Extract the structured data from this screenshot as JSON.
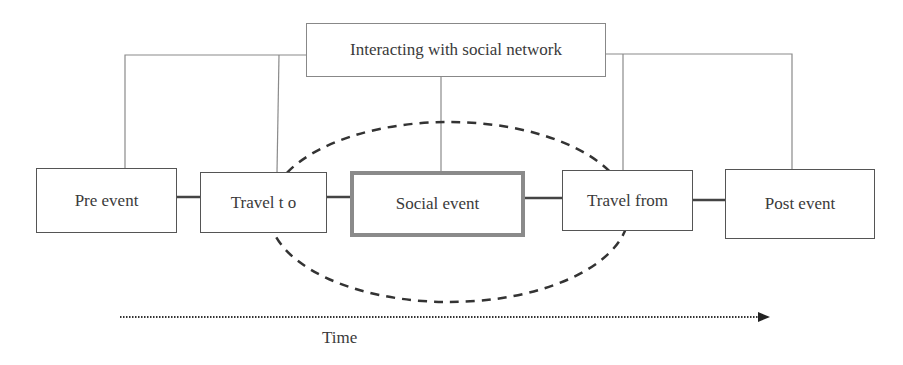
{
  "diagram": {
    "hub": {
      "label": "Interacting with social network"
    },
    "stages": [
      {
        "id": "pre-event",
        "label": "Pre event"
      },
      {
        "id": "travel-to",
        "label": "Travel t o"
      },
      {
        "id": "social-event",
        "label": "Social event",
        "highlighted": true
      },
      {
        "id": "travel-from",
        "label": "Travel from"
      },
      {
        "id": "post-event",
        "label": "Post event"
      }
    ],
    "axis": {
      "label": "Time",
      "direction": "left-to-right"
    },
    "colors": {
      "line": "#555555",
      "thin_line": "#8a8a8a",
      "highlight_border": "#8a8a8a",
      "ellipse": "#333333"
    }
  }
}
